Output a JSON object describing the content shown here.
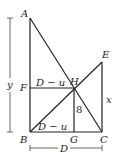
{
  "diagram": {
    "points": {
      "A": {
        "label": "A",
        "x": 30,
        "y": 18
      },
      "B": {
        "label": "B",
        "x": 30,
        "y": 132
      },
      "C": {
        "label": "C",
        "x": 102,
        "y": 132
      },
      "E": {
        "label": "E",
        "x": 102,
        "y": 62
      },
      "F": {
        "label": "F",
        "x": 30,
        "y": 88
      },
      "G": {
        "label": "G",
        "x": 74,
        "y": 132
      },
      "H": {
        "label": "H",
        "x": 74,
        "y": 88
      }
    },
    "segment_labels": {
      "FH": "D − u",
      "BG": "D − u",
      "HG": "8",
      "EC": "x",
      "y_dim": "y",
      "D_dim": "D"
    },
    "colors": {
      "line": "#222222",
      "background": "#ffffff"
    }
  }
}
